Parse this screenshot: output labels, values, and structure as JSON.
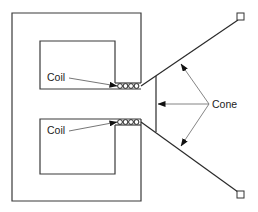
{
  "diagram": {
    "type": "loudspeaker-cross-section",
    "labels": {
      "coil_upper": "Coil",
      "coil_lower": "Coil",
      "cone": "Cone"
    },
    "colors": {
      "line": "#3a3a3a",
      "arrow": "#777777",
      "background": "#ffffff"
    }
  }
}
